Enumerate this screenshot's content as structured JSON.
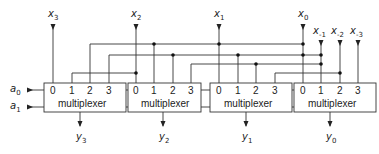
{
  "diagram": {
    "type": "multiplexer shifter circuit",
    "select_inputs": [
      {
        "name": "a",
        "sub": "0"
      },
      {
        "name": "a",
        "sub": "1"
      }
    ],
    "data_inputs": [
      {
        "name": "x",
        "sub": "3"
      },
      {
        "name": "x",
        "sub": "2"
      },
      {
        "name": "x",
        "sub": "1"
      },
      {
        "name": "x",
        "sub": "0"
      },
      {
        "name": "x",
        "sub": "-1"
      },
      {
        "name": "x",
        "sub": "-2"
      },
      {
        "name": "x",
        "sub": "-3"
      }
    ],
    "multiplexers": [
      {
        "label": "multiplexer",
        "pins": [
          "0",
          "1",
          "2",
          "3"
        ],
        "output": {
          "name": "y",
          "sub": "3"
        }
      },
      {
        "label": "multiplexer",
        "pins": [
          "0",
          "1",
          "2",
          "3"
        ],
        "output": {
          "name": "y",
          "sub": "2"
        }
      },
      {
        "label": "multiplexer",
        "pins": [
          "0",
          "1",
          "2",
          "3"
        ],
        "output": {
          "name": "y",
          "sub": "1"
        }
      },
      {
        "label": "multiplexer",
        "pins": [
          "0",
          "1",
          "2",
          "3"
        ],
        "output": {
          "name": "y",
          "sub": "0"
        }
      }
    ],
    "line_color": "#333333",
    "background": "#ffffff"
  }
}
